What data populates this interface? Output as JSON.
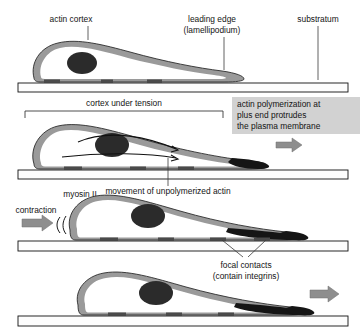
{
  "figure": {
    "panel_count": 4
  },
  "labels": {
    "actin_cortex": "actin cortex",
    "leading_edge_line1": "leading edge",
    "leading_edge_line2": "(lamellipodium)",
    "substratum": "substratum",
    "cortex_under_tension": "cortex under tension",
    "movement_unpolymerized": "movement of unpolymerized actin",
    "myosin": "myosin II",
    "contraction": "contraction",
    "focal_contacts_line1": "focal contacts",
    "focal_contacts_line2": "(contain integrins)"
  },
  "callout": {
    "line1": "actin polymerization at",
    "line2": "plus end protrudes",
    "line3": "the plasma membrane",
    "background": "#d2d2d2",
    "text_color": "#141414"
  },
  "colors": {
    "cortex_gray": "#9a9a9a",
    "cortex_dark": "#7d7d7d",
    "nucleus": "#2b2b2b",
    "cytoplasm": "#ffffff",
    "outline": "#2e2e2e",
    "substratum_fill": "#fdfdfd",
    "substratum_stroke": "#111111",
    "focal_contact": "#4a4a4a",
    "protrusion_tip": "#151515",
    "block_arrow": "#8e8e8e",
    "page_background": "#ffffff"
  },
  "panels": [
    {
      "index": 1,
      "name": "resting-polarized-cell",
      "labels": [
        "actin cortex",
        "leading edge (lamellipodium)",
        "substratum"
      ],
      "features": [
        "cell body",
        "nucleus",
        "actin cortex band",
        "focal contacts",
        "substratum bar"
      ]
    },
    {
      "index": 2,
      "name": "protrusion-panel",
      "labels": [
        "cortex under tension",
        "actin polymerization at plus end protrudes the plasma membrane",
        "movement of unpolymerized actin"
      ],
      "features": [
        "tension bracket",
        "internal flow arrows",
        "dark leading tip",
        "block arrow right",
        "callout box"
      ]
    },
    {
      "index": 3,
      "name": "contraction-panel",
      "labels": [
        "myosin II",
        "contraction",
        "focal contacts (contain integrins)"
      ],
      "features": [
        "contraction block arrow",
        "rear contraction arcs",
        "dark leading tail",
        "focal contacts leaders"
      ]
    },
    {
      "index": 4,
      "name": "translocation-panel",
      "labels": [],
      "features": [
        "cell translocated forward",
        "dark leading tail",
        "block arrow right"
      ]
    }
  ]
}
